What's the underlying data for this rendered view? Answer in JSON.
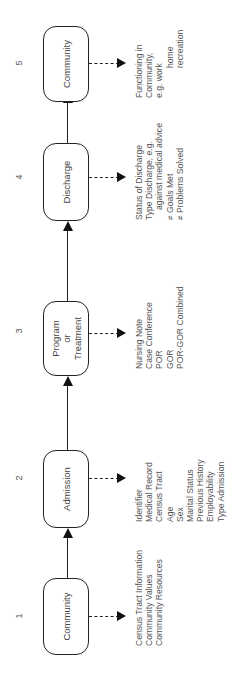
{
  "diagram": {
    "stages": [
      {
        "number": "1",
        "label": "Community",
        "details": [
          "Census Tract Information",
          "Community Values",
          "Community Resources"
        ]
      },
      {
        "number": "2",
        "label": "Admission",
        "details": [
          "Identifier",
          "Medical Record",
          "Census Tract",
          "Age",
          "Sex",
          "Marital Status",
          "Previous History",
          "Employability",
          "Type Admission"
        ]
      },
      {
        "number": "3",
        "label_line1": "Program",
        "label_line2": "or",
        "label_line3": "Treatment",
        "details": [
          "Nursing Note",
          "Case Conference",
          "POR",
          "GOR",
          "POR-GOR Combined"
        ]
      },
      {
        "number": "4",
        "label": "Discharge",
        "details": [
          "Status of Discharge",
          "Type Discharge, e.g.",
          "against medical advice",
          "≠ Goals Met",
          "≠ Problems Solved"
        ]
      },
      {
        "number": "5",
        "label": "Community",
        "details": [
          "Functioning in",
          "Community,",
          "e.g. work",
          "home",
          "recreation"
        ]
      }
    ]
  }
}
